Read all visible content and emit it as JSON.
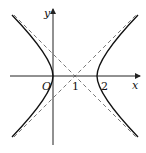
{
  "figure": {
    "type": "hyperbola",
    "axes": {
      "x_label": "x",
      "y_label": "y",
      "origin_label": "O"
    },
    "tick_labels": [
      "1",
      "2"
    ],
    "center": [
      1,
      0
    ],
    "vertices": [
      [
        0,
        0
      ],
      [
        2,
        0
      ]
    ],
    "asymptote_slopes": [
      1,
      -1
    ],
    "colors": {
      "curve": "#111111",
      "asymptote": "#555555",
      "axis": "#222222"
    }
  }
}
